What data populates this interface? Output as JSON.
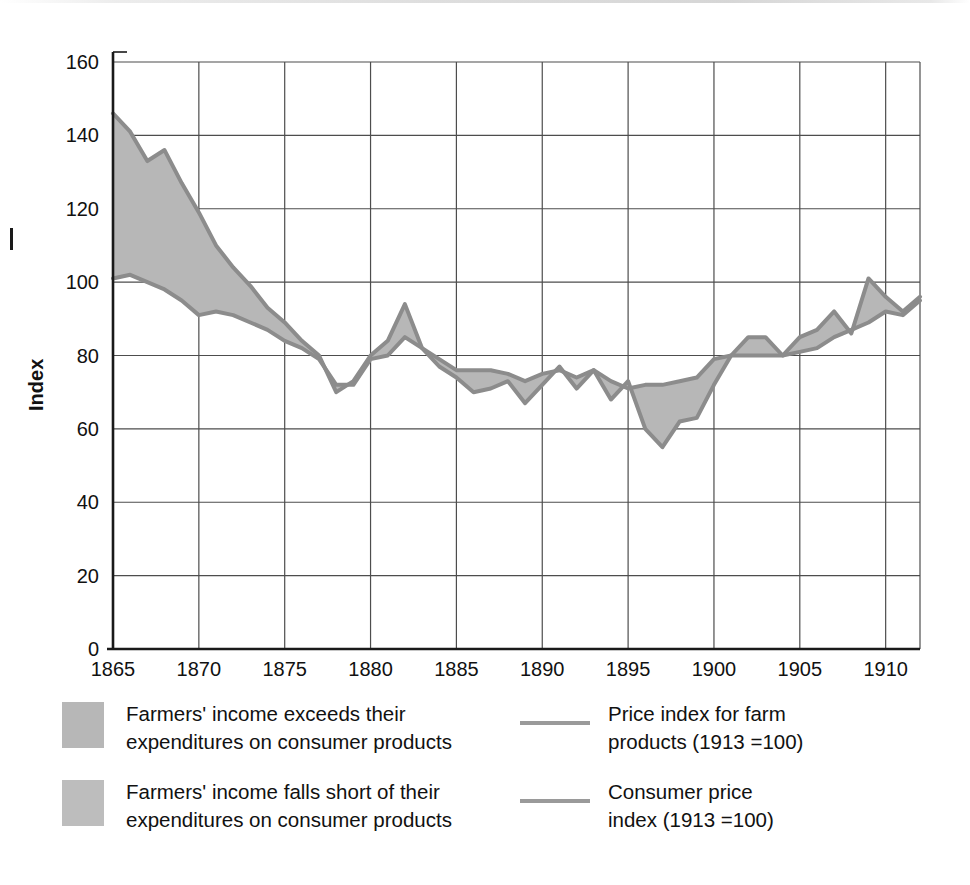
{
  "chart_data": {
    "type": "area",
    "title": "",
    "xlabel": "",
    "ylabel": "Index",
    "ylim": [
      0,
      160
    ],
    "xlim": [
      1865,
      1912
    ],
    "y_ticks": [
      0,
      20,
      40,
      60,
      80,
      100,
      120,
      140,
      160
    ],
    "x_ticks": [
      1865,
      1870,
      1875,
      1880,
      1885,
      1890,
      1895,
      1900,
      1905,
      1910
    ],
    "grid": true,
    "legend_position": "below",
    "x": [
      1865,
      1866,
      1867,
      1868,
      1869,
      1870,
      1871,
      1872,
      1873,
      1874,
      1875,
      1876,
      1877,
      1878,
      1879,
      1880,
      1881,
      1882,
      1883,
      1884,
      1885,
      1886,
      1887,
      1888,
      1889,
      1890,
      1891,
      1892,
      1893,
      1894,
      1895,
      1896,
      1897,
      1898,
      1899,
      1900,
      1901,
      1902,
      1903,
      1904,
      1905,
      1906,
      1907,
      1908,
      1909,
      1910,
      1911,
      1912
    ],
    "series": [
      {
        "name": "Price index for farm products (1913 =100)",
        "color": "#8c8c8c",
        "values": [
          146,
          141,
          133,
          136,
          127,
          119,
          110,
          104,
          99,
          93,
          89,
          84,
          80,
          70,
          73,
          80,
          84,
          94,
          82,
          77,
          74,
          70,
          71,
          73,
          67,
          72,
          77,
          71,
          76,
          68,
          73,
          60,
          55,
          62,
          63,
          72,
          80,
          85,
          85,
          80,
          85,
          87,
          92,
          86,
          101,
          96,
          92,
          96
        ]
      },
      {
        "name": "Consumer price index (1913 =100)",
        "color": "#8c8c8c",
        "values": [
          101,
          102,
          100,
          98,
          95,
          91,
          92,
          91,
          89,
          87,
          84,
          82,
          79,
          72,
          72,
          79,
          80,
          85,
          82,
          79,
          76,
          76,
          76,
          75,
          73,
          75,
          76,
          74,
          76,
          73,
          71,
          72,
          72,
          73,
          74,
          79,
          80,
          80,
          80,
          80,
          81,
          82,
          85,
          87,
          89,
          92,
          91,
          95
        ]
      }
    ],
    "fill_color": "#b7b7b7",
    "fill_semantics": {
      "above": "Farmers' income exceeds their expenditures on consumer products",
      "below": "Farmers' income falls short of their expenditures on consumer products"
    }
  },
  "axes": {
    "y_label": "Index",
    "y_tick_labels": [
      "160",
      "140",
      "120",
      "100",
      "80",
      "60",
      "40",
      "20",
      "0"
    ],
    "x_tick_labels": [
      "1865",
      "1870",
      "1875",
      "1880",
      "1885",
      "1890",
      "1895",
      "1900",
      "1905",
      "1910"
    ]
  },
  "legend": {
    "area_items": [
      {
        "label": "Farmers' income exceeds their\nexpenditures on consumer products",
        "color": "#b7b7b7",
        "icon": "area-swatch"
      },
      {
        "label": "Farmers' income falls short of their\nexpenditures on consumer products",
        "color": "#bdbdbd",
        "icon": "area-swatch"
      }
    ],
    "line_items": [
      {
        "label": "Price index for farm\nproducts (1913 =100)",
        "color": "#9a9a9a",
        "icon": "line-swatch"
      },
      {
        "label": "Consumer price\nindex (1913 =100)",
        "color": "#9a9a9a",
        "icon": "line-swatch"
      }
    ]
  },
  "colors": {
    "fill": "#b7b7b7",
    "line": "#8c8c8c",
    "axis": "#1a1a1a",
    "grid": "#4d4d4d",
    "background": "#ffffff"
  }
}
